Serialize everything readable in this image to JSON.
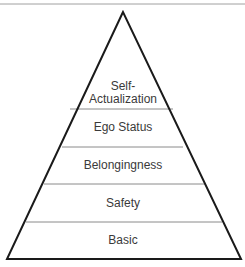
{
  "diagram": {
    "type": "pyramid",
    "levels": [
      {
        "label_line1": "Self-",
        "label_line2": "Actualization"
      },
      {
        "label": "Ego Status"
      },
      {
        "label": "Belongingness"
      },
      {
        "label": "Safety"
      },
      {
        "label": "Basic"
      }
    ],
    "colors": {
      "outline": "#1a1a1a",
      "divider": "#8a8a8a",
      "top_rule": "#a0a0a0"
    }
  }
}
